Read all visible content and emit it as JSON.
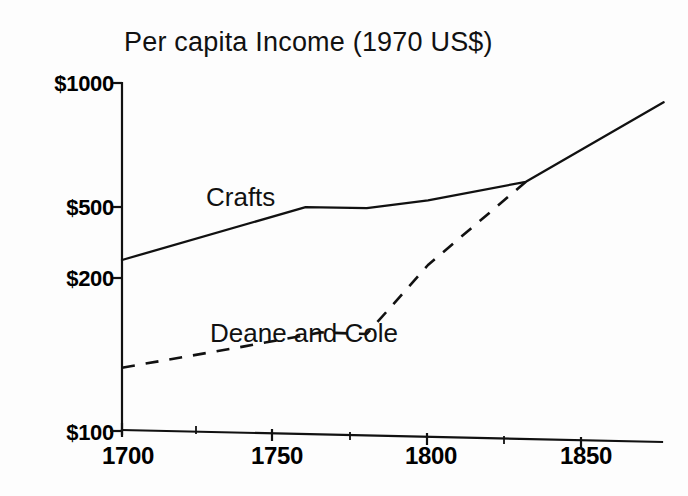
{
  "chart_data": {
    "type": "line",
    "title": "Per capita Income (1970 US$)",
    "xlabel": "",
    "ylabel": "",
    "yscale": "log",
    "xlim": [
      1700,
      1877
    ],
    "ylim": [
      100,
      1000
    ],
    "grid": false,
    "legend": "inline-labels",
    "ytick_labels": [
      "$1000",
      "$500",
      "$200",
      "$100"
    ],
    "ytick_values": [
      1000,
      500,
      200,
      100
    ],
    "xtick_labels": [
      "1700",
      "1750",
      "1800",
      "1850"
    ],
    "xtick_values": [
      1700,
      1750,
      1800,
      1850
    ],
    "xtick_minor_values": [
      1725,
      1775,
      1825
    ],
    "series": [
      {
        "name": "Crafts",
        "style": "solid",
        "label_text": "Crafts",
        "x": [
          1700,
          1760,
          1780,
          1800,
          1832,
          1877
        ],
        "values": [
          310,
          440,
          437,
          460,
          520,
          880
        ]
      },
      {
        "name": "Deane and Cole",
        "style": "dashed",
        "label_text": "Deane and Cole",
        "x": [
          1700,
          1740,
          1765,
          1780,
          1800,
          1832
        ],
        "values": [
          152,
          175,
          192,
          190,
          300,
          520
        ]
      }
    ]
  },
  "axis": {
    "y_tick_label_0": "$1000",
    "y_tick_label_1": "$500",
    "y_tick_label_2": "$200",
    "y_tick_label_3": "$100",
    "x_tick_label_0": "1700",
    "x_tick_label_1": "1750",
    "x_tick_label_2": "1800",
    "x_tick_label_3": "1850"
  },
  "colors": {
    "ink": "#111111",
    "paper": "#ffffff"
  }
}
